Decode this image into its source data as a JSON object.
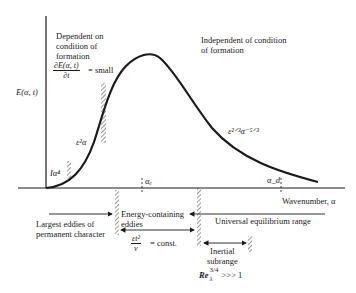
{
  "diagram": {
    "y_axis_label": "E(α, t)",
    "x_axis_label": "Wavenumber, α",
    "regions": {
      "dependent": [
        "Dependent on",
        "condition of",
        "formation"
      ],
      "independent": [
        "Independent of condition",
        "of formation"
      ]
    },
    "derivative_note": {
      "numerator": "∂E(α, t)",
      "denominator": "∂t",
      "suffix": "= small"
    },
    "curve_labels": {
      "low": "Iα⁴",
      "mid": "ε²α",
      "inertial": "ε²ᐟ³α⁻⁵ᐟ³"
    },
    "markers": {
      "alpha_e": "αₑ",
      "alpha_d": "α_d"
    },
    "ranges": {
      "largest_eddies": [
        "Largest eddies of",
        "permanent character"
      ],
      "energy_containing": [
        "Energy-containing",
        "eddies"
      ],
      "universal": "Universal equilibrium range",
      "inertial": [
        "Inertial",
        "subrange"
      ]
    },
    "conditions": {
      "const_num": "εt²",
      "const_den": "ν",
      "const_suffix": "= const.",
      "reynolds": "Re",
      "reynolds_sub": "λ",
      "reynolds_sup": "3/4",
      "reynolds_suffix": ">>> 1"
    },
    "colors": {
      "ink": "#1a1a1a",
      "background": "#ffffff"
    }
  }
}
